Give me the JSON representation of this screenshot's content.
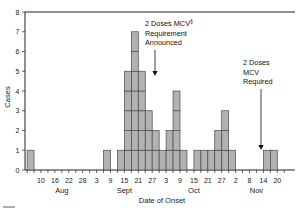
{
  "chart_data": {
    "type": "bar",
    "title": "",
    "xlabel": "Date of Onset",
    "ylabel": "Cases",
    "ylim": [
      0,
      8
    ],
    "yticks": [
      "0",
      "1",
      "2",
      "3",
      "4",
      "5",
      "6",
      "7",
      "8"
    ],
    "grid": false,
    "legend": false,
    "bin_days": 3,
    "bin_count": 37,
    "x_tick_every_bins": 2,
    "x_tick_first_bin": 2,
    "x_tick_labels": [
      "10",
      "16",
      "22",
      "28",
      "3",
      "9",
      "15",
      "21",
      "27",
      "3",
      "9",
      "15",
      "21",
      "27",
      "2",
      "8",
      "14",
      "20"
    ],
    "month_labels": [
      {
        "label": "Aug",
        "bin": 5.0
      },
      {
        "label": "Sept",
        "bin": 14.0
      },
      {
        "label": "Oct",
        "bin": 24.0
      },
      {
        "label": "Nov",
        "bin": 33.0
      }
    ],
    "categories": [
      "Aug 4",
      "Aug 7",
      "Aug 10",
      "Aug 13",
      "Aug 16",
      "Aug 19",
      "Aug 22",
      "Aug 25",
      "Aug 28",
      "Aug 31",
      "Sept 3",
      "Sept 6",
      "Sept 9",
      "Sept 12",
      "Sept 15",
      "Sept 18",
      "Sept 21",
      "Sept 24",
      "Sept 27",
      "Sept 30",
      "Oct 3",
      "Oct 6",
      "Oct 9",
      "Oct 12",
      "Oct 15",
      "Oct 18",
      "Oct 21",
      "Oct 24",
      "Oct 27",
      "Oct 30",
      "Nov 2",
      "Nov 5",
      "Nov 8",
      "Nov 11",
      "Nov 14",
      "Nov 17",
      "Nov 20"
    ],
    "values": [
      1,
      0,
      0,
      0,
      0,
      0,
      0,
      0,
      0,
      0,
      0,
      1,
      0,
      1,
      5,
      7,
      5,
      3,
      2,
      1,
      2,
      4,
      1,
      0,
      1,
      1,
      1,
      2,
      3,
      1,
      0,
      0,
      0,
      0,
      1,
      1,
      0
    ],
    "annotations": [
      {
        "id": "mcv-announced",
        "lines": [
          "2 Doses MCV",
          "Requirement",
          "Announced"
        ],
        "superscript": "§",
        "text_x": 145,
        "text_y": 26,
        "leader_x": 155,
        "leader_y0": 50,
        "leader_y1": 76
      },
      {
        "id": "mcv-required",
        "lines": [
          "2 Doses",
          "MCV",
          "Required"
        ],
        "superscript": "",
        "text_x": 243,
        "text_y": 65,
        "leader_x": 261,
        "leader_y0": 89,
        "leader_y1": 150
      }
    ]
  },
  "colors": {
    "bar_fill": "#b2b2b2",
    "bar_stroke": "#4a4a4a",
    "axis": "#222222",
    "text": "#111111",
    "background": "#ffffff"
  }
}
